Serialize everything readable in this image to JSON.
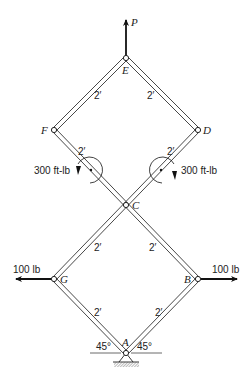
{
  "figure": {
    "corner_text": "",
    "joints": [
      {
        "id": "E",
        "label": "E",
        "x": 126,
        "y": 58
      },
      {
        "id": "F",
        "label": "F",
        "x": 54,
        "y": 130
      },
      {
        "id": "D",
        "label": "D",
        "x": 198,
        "y": 130
      },
      {
        "id": "C",
        "label": "C",
        "x": 126,
        "y": 205
      },
      {
        "id": "G",
        "label": "G",
        "x": 54,
        "y": 279
      },
      {
        "id": "B",
        "label": "B",
        "x": 198,
        "y": 279
      },
      {
        "id": "A",
        "label": "A",
        "x": 126,
        "y": 353
      }
    ],
    "members": [
      {
        "from": "E",
        "to": "F",
        "length_label": "2′"
      },
      {
        "from": "E",
        "to": "D",
        "length_label": "2′"
      },
      {
        "from": "F",
        "to": "B",
        "length_label": "2′ + 2′ + 2′"
      },
      {
        "from": "D",
        "to": "G",
        "length_label": "2′ + 2′ + 2′"
      },
      {
        "from": "G",
        "to": "A",
        "length_label": "2′"
      },
      {
        "from": "B",
        "to": "A",
        "length_label": "2′"
      }
    ],
    "dimension_labels": {
      "ef": "2′",
      "ed": "2′",
      "fc": "2′",
      "dc": "2′",
      "cg": "2′",
      "cb": "2′",
      "ga": "2′",
      "ba": "2′"
    },
    "loads": {
      "P": {
        "label": "P",
        "direction": "up",
        "at": "E"
      },
      "left_force": {
        "label": "100 lb",
        "direction": "left",
        "at": "G"
      },
      "right_force": {
        "label": "100 lb",
        "direction": "right",
        "at": "B"
      },
      "left_moment": {
        "label": "300 ft-lb",
        "sense": "counterclockwise",
        "on": "FC"
      },
      "right_moment": {
        "label": "300 ft-lb",
        "sense": "clockwise",
        "on": "DC"
      }
    },
    "support": {
      "at": "A",
      "type": "pin",
      "angle_left": "45°",
      "angle_right": "45°"
    }
  }
}
